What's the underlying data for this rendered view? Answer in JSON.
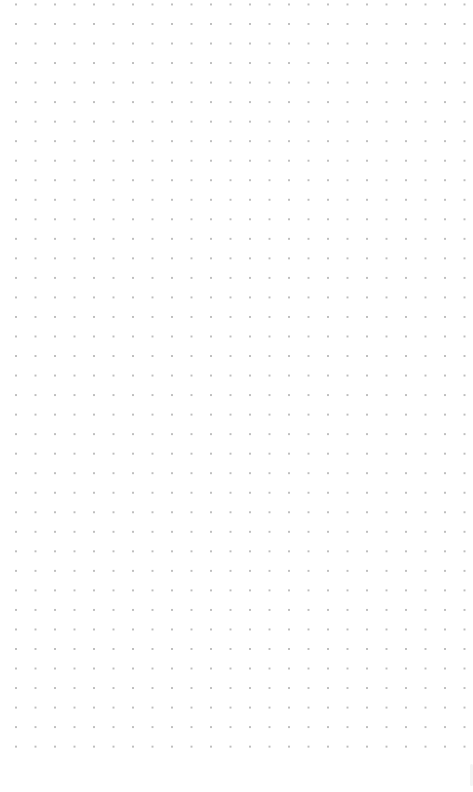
{
  "canvas": {
    "type": "dot-grid",
    "background_color": "#ffffff",
    "dot_color": "#bdbdbd",
    "grid_spacing_px": 19.5,
    "columns": 24,
    "rows": 38,
    "first_dot": {
      "x": 16,
      "y": 24
    },
    "last_dot": {
      "x": 465,
      "y": 747
    }
  }
}
